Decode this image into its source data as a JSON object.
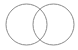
{
  "diagram": {
    "type": "venn",
    "sets": [
      {
        "id": "left",
        "cx": 26.5,
        "cy": 24.5,
        "r": 20.5
      },
      {
        "id": "right",
        "cx": 53.5,
        "cy": 24.5,
        "r": 20.5
      }
    ],
    "stroke_color": "#8a8a8a",
    "fill_color": "none"
  }
}
